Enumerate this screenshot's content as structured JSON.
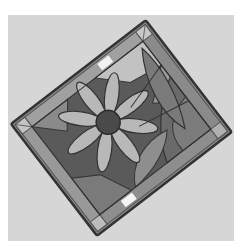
{
  "image": {
    "subject": "Stained glass panel with flower design",
    "caption": "Rotated stained glass panel featuring a daisy-like flower with leaves",
    "palette": {
      "background": "#d6d6d6",
      "frame_lead": "#3a3a3a",
      "border_strip": "#8c8c8c",
      "border_highlight": "#eeeeee",
      "panel_dark": "#555555",
      "petal": "#b4b4b4",
      "flower_center": "#4a4a4a",
      "leaf": "#6e6e6e",
      "light_glass": "#c8c8c8"
    }
  }
}
